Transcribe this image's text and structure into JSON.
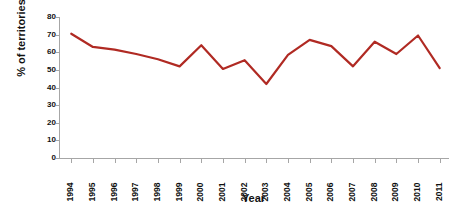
{
  "chart_data": {
    "type": "line",
    "title": "",
    "subtitle": "",
    "xlabel": "Year",
    "ylabel": "% of territories",
    "categories": [
      "1994",
      "1995",
      "1996",
      "1997",
      "1998",
      "1999",
      "2000",
      "2001",
      "2002",
      "2003",
      "2004",
      "2005",
      "2006",
      "2007",
      "2008",
      "2009",
      "2010",
      "2011"
    ],
    "values": [
      70.5,
      63.0,
      61.5,
      59.0,
      56.0,
      52.0,
      64.0,
      50.5,
      55.5,
      42.0,
      58.5,
      67.0,
      63.5,
      52.0,
      66.0,
      59.0,
      69.5,
      51.0
    ],
    "series": [
      {
        "name": "% of territories",
        "color": "#B02A23",
        "values": [
          70.5,
          63.0,
          61.5,
          59.0,
          56.0,
          52.0,
          64.0,
          50.5,
          55.5,
          42.0,
          58.5,
          67.0,
          63.5,
          52.0,
          66.0,
          59.0,
          69.5,
          51.0
        ]
      }
    ],
    "ylim": [
      0,
      80
    ],
    "ytick_labels": [
      "0",
      "10",
      "20",
      "30",
      "40",
      "50",
      "60",
      "70",
      "80"
    ],
    "ytick_values": [
      0,
      10,
      20,
      30,
      40,
      50,
      60,
      70,
      80
    ],
    "grid": false,
    "legend": false,
    "legend_position": "none",
    "markers": false,
    "line_width": 2.2,
    "axis_color": "#A6A6A6",
    "background": "#FFFFFF",
    "text_color": "#111111"
  }
}
